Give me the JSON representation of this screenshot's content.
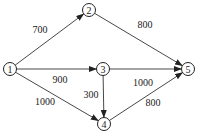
{
  "diagram": {
    "type": "directed-weighted-graph",
    "nodes": [
      {
        "id": "1",
        "label": "1",
        "x": 10,
        "y": 69
      },
      {
        "id": "2",
        "label": "2",
        "x": 89,
        "y": 10
      },
      {
        "id": "3",
        "label": "3",
        "x": 103,
        "y": 69
      },
      {
        "id": "4",
        "label": "4",
        "x": 104,
        "y": 124
      },
      {
        "id": "5",
        "label": "5",
        "x": 188,
        "y": 69
      }
    ],
    "edges": [
      {
        "from": "1",
        "to": "2",
        "weight": "700",
        "lx": 40,
        "ly": 33
      },
      {
        "from": "1",
        "to": "3",
        "weight": "900",
        "lx": 60,
        "ly": 83
      },
      {
        "from": "1",
        "to": "4",
        "weight": "1000",
        "lx": 45,
        "ly": 105
      },
      {
        "from": "2",
        "to": "5",
        "weight": "800",
        "lx": 145,
        "ly": 28
      },
      {
        "from": "3",
        "to": "5",
        "weight": "1000",
        "lx": 143,
        "ly": 86
      },
      {
        "from": "3",
        "to": "4",
        "weight": "300",
        "lx": 91,
        "ly": 98
      },
      {
        "from": "4",
        "to": "5",
        "weight": "800",
        "lx": 153,
        "ly": 106
      }
    ]
  }
}
